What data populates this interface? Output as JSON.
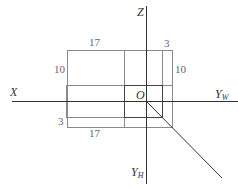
{
  "diagram": {
    "type": "three-view projection axes",
    "axes": {
      "x_label": "X",
      "z_label": "Z",
      "yw_label": "Y",
      "yw_sub": "W",
      "yh_label": "Y",
      "yh_sub": "H",
      "origin_label": "O"
    },
    "dimensions": {
      "top_width": "17",
      "top_right": "3",
      "left_height": "10",
      "right_height": "10",
      "bottom_left": "3",
      "bottom_width": "17"
    },
    "colors": {
      "axis": "#333333",
      "outline": "#888888",
      "text": "#666666"
    }
  }
}
